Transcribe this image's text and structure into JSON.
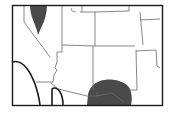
{
  "map": {
    "type": "species-range-map",
    "region": "Southwestern United States",
    "colors": {
      "background": "#ffffff",
      "frame": "#1a1a1a",
      "state_border": "#6a6a6a",
      "coast": "#1a1a1a",
      "range_fill": "#4a4a4a"
    },
    "range_areas": [
      {
        "id": "range-north",
        "label": ""
      },
      {
        "id": "range-south",
        "label": ""
      }
    ]
  }
}
